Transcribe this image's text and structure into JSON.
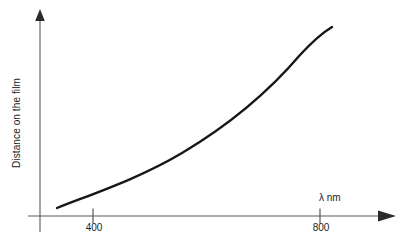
{
  "figure": {
    "background_color": "#ffffff",
    "curve_color": "#17171a",
    "axis_color": "#5a5a5a",
    "text_color": "#1b1b1b"
  },
  "axes": {
    "y_title": "Distance on the film",
    "x_title": "λ nm",
    "x_tick_labels": [
      "400",
      "800"
    ],
    "origin_px": {
      "x": 40,
      "y": 216
    },
    "x_axis_end_px": 395,
    "y_axis_top_px": 10,
    "y_axis_bottom_px": 232,
    "x_tick_px": [
      93,
      320
    ],
    "arrowheads": {
      "x": true,
      "y": true
    }
  },
  "chart_data": {
    "type": "line",
    "title": "",
    "subtitle": "",
    "xlabel": "λ nm",
    "ylabel": "Distance on the film",
    "xlim": [
      370,
      850
    ],
    "ylim": [
      0,
      1
    ],
    "grid": false,
    "legend": null,
    "xticks": [
      400,
      800
    ],
    "xticklabels": [
      "400",
      "800"
    ],
    "yticks": [],
    "yticklabels": [],
    "annotations": [
      {
        "text": "λ nm",
        "x": 820,
        "y": 0.06,
        "position": "above-axis-right"
      }
    ],
    "series": [
      {
        "name": "Dispersion curve",
        "color": "#17171a",
        "linewidth": 2.4,
        "x": [
          400,
          410,
          425,
          445,
          465,
          490,
          520,
          550,
          580,
          610,
          640,
          670,
          700,
          730,
          760,
          790,
          815,
          835,
          850
        ],
        "y": [
          0.04,
          0.055,
          0.075,
          0.105,
          0.135,
          0.175,
          0.225,
          0.275,
          0.33,
          0.385,
          0.445,
          0.51,
          0.58,
          0.655,
          0.735,
          0.825,
          0.9,
          0.955,
          1.0
        ],
        "x_px": [
          57,
          63,
          71,
          82,
          94,
          108,
          125,
          142,
          159,
          176,
          193,
          210,
          227,
          244,
          261,
          278,
          292,
          304,
          313
        ],
        "y_px": [
          208,
          205,
          200,
          193,
          186,
          177,
          166,
          155,
          143,
          131,
          118,
          104,
          89,
          73,
          55,
          36,
          27,
          27,
          27
        ],
        "shape": "convex-increasing (exponential-like)"
      }
    ],
    "path_px": "M 57,208 C 95,193 140,178 182,153 C 224,128 265,96 300,55 C 312,42 322,33 332,27",
    "curve_start_px": {
      "x": 57,
      "y": 208
    },
    "curve_end_px": {
      "x": 332,
      "y": 27
    }
  }
}
